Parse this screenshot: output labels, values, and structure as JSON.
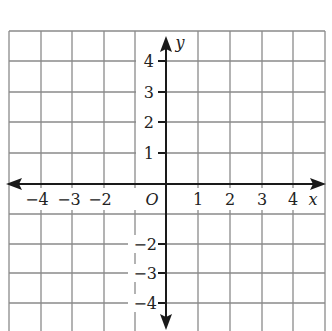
{
  "diagram": {
    "type": "coordinate-plane",
    "x_axis_label": "x",
    "y_axis_label": "y",
    "origin_label": "O",
    "x_tick_labels": [
      {
        "value": -4,
        "text": "−4"
      },
      {
        "value": -3,
        "text": "−3"
      },
      {
        "value": -2,
        "text": "−2"
      },
      {
        "value": 1,
        "text": "1"
      },
      {
        "value": 2,
        "text": "2"
      },
      {
        "value": 3,
        "text": "3"
      },
      {
        "value": 4,
        "text": "4"
      }
    ],
    "y_tick_labels": [
      {
        "value": 4,
        "text": "4"
      },
      {
        "value": 3,
        "text": "3"
      },
      {
        "value": 2,
        "text": "2"
      },
      {
        "value": 1,
        "text": "1"
      },
      {
        "value": -2,
        "text": "−2"
      },
      {
        "value": -3,
        "text": "−3"
      },
      {
        "value": -4,
        "text": "−4"
      }
    ],
    "x_range": [
      -5,
      5
    ],
    "y_range": [
      -4.5,
      5
    ],
    "grid": true,
    "colors": {
      "grid": "#8a8a8a",
      "axis": "#1a1a1a",
      "background": "#ffffff"
    }
  }
}
